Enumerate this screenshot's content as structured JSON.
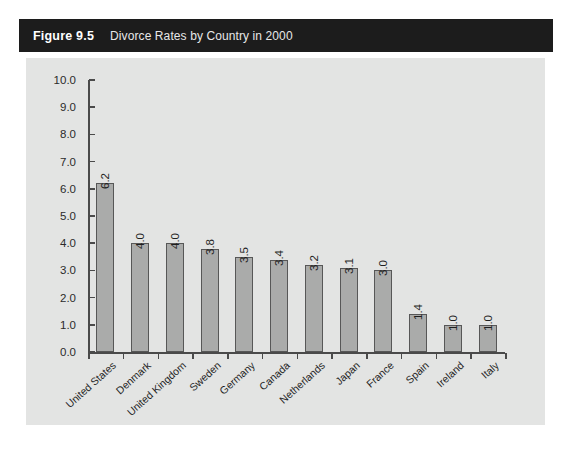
{
  "caption": {
    "number": "Figure 9.5",
    "title": "Divorce Rates by Country in 2000"
  },
  "colors": {
    "caption_bar": "#1c1c1c",
    "panel_background": "#e3e4e3",
    "bar_fill": "#aaabaa",
    "bar_border": "#575757",
    "axis": "#4a4a4a",
    "page_background": "#ffffff"
  },
  "chart_data": {
    "type": "bar",
    "title": "Divorce Rates by Country in 2000",
    "xlabel": "",
    "ylabel": "",
    "categories": [
      "United States",
      "Denmark",
      "United Kingdom",
      "Sweden",
      "Germany",
      "Canada",
      "Netherlands",
      "Japan",
      "France",
      "Spain",
      "Ireland",
      "Italy"
    ],
    "values": [
      6.2,
      4.0,
      4.0,
      3.8,
      3.5,
      3.4,
      3.2,
      3.1,
      3.0,
      1.4,
      1.0,
      1.0
    ],
    "value_labels": [
      "6.2",
      "4.0",
      "4.0",
      "3.8",
      "3.5",
      "3.4",
      "3.2",
      "3.1",
      "3.0",
      "1.4",
      "1.0",
      "1.0"
    ],
    "ylim": [
      0.0,
      10.0
    ],
    "ytick_labels": [
      "10.0",
      "9.0",
      "8.0",
      "7.0",
      "6.0",
      "5.0",
      "4.0",
      "3.0",
      "2.0",
      "1.0",
      "0.0"
    ],
    "ytick_values": [
      10.0,
      9.0,
      8.0,
      7.0,
      6.0,
      5.0,
      4.0,
      3.0,
      2.0,
      1.0,
      0.0
    ],
    "grid": false,
    "legend": false,
    "value_label_rotation": 90,
    "category_label_rotation": 42
  }
}
